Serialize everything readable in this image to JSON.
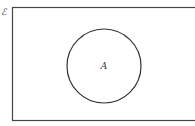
{
  "diagram": {
    "type": "venn",
    "universal_set": {
      "label": "ℰ"
    },
    "sets": [
      {
        "label": "A"
      }
    ],
    "colors": {
      "stroke": "#333333",
      "background": "#ffffff"
    }
  }
}
